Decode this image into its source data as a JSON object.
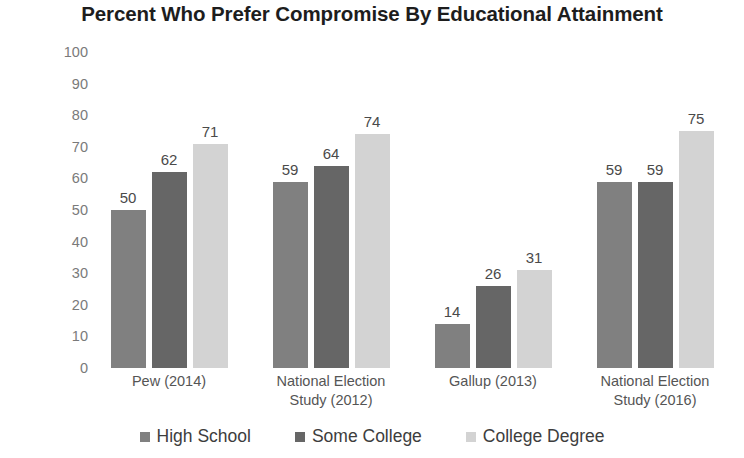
{
  "chart_data": {
    "type": "bar",
    "title": "Percent Who Prefer Compromise By Educational Attainment",
    "xlabel": "",
    "ylabel": "",
    "ylim": [
      0,
      100
    ],
    "ytick_step": 10,
    "yticks": [
      "100",
      "90",
      "80",
      "70",
      "60",
      "50",
      "40",
      "30",
      "20",
      "10",
      "0"
    ],
    "grid": false,
    "legend_position": "bottom-center",
    "categories": [
      "Pew (2014)",
      "National Election Study (2012)",
      "Gallup (2013)",
      "National Election Study (2016)"
    ],
    "category_lines": [
      [
        "Pew (2014)"
      ],
      [
        "National Election",
        "Study (2012)"
      ],
      [
        "Gallup (2013)"
      ],
      [
        "National Election",
        "Study (2016)"
      ]
    ],
    "series": [
      {
        "name": "High School",
        "color": "#808080",
        "values": [
          50,
          59,
          14,
          59
        ]
      },
      {
        "name": "Some College",
        "color": "#666666",
        "values": [
          62,
          64,
          26,
          59
        ]
      },
      {
        "name": "College Degree",
        "color": "#d3d3d3",
        "values": [
          71,
          74,
          31,
          75
        ]
      }
    ]
  },
  "legend": {
    "items": [
      {
        "label": "High School",
        "color": "#808080"
      },
      {
        "label": "Some College",
        "color": "#666666"
      },
      {
        "label": "College Degree",
        "color": "#d3d3d3"
      }
    ]
  },
  "colors": {
    "background": "#ffffff",
    "title": "#1d1d1d",
    "axis_text": "#7a7a7a",
    "data_label": "#4a4a4a",
    "category_text": "#555555"
  }
}
